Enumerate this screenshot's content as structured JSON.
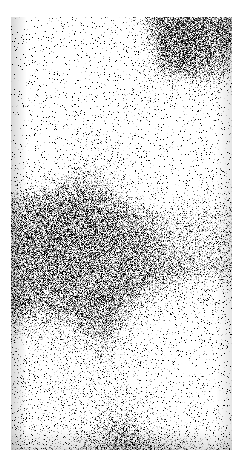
{
  "page": {
    "width": 246,
    "height": 466,
    "background_color": "#ffffff"
  },
  "photo": {
    "label": "grain-photograph",
    "description": "High-contrast grainy monochrome photograph",
    "x": 11,
    "y": 17,
    "width": 221,
    "height": 433,
    "palette": {
      "highlight": "#ffffff",
      "light": "#e8e8e8",
      "midtone": "#8a8a8a",
      "shadow": "#2a2a2a",
      "black": "#141414"
    },
    "regions": [
      {
        "name": "upper-left-highlight",
        "tone": "bright",
        "value": "#f4f4f4"
      },
      {
        "name": "upper-right-shadow",
        "tone": "dark",
        "value": "#1a1a1a"
      },
      {
        "name": "mid-right-light-patch",
        "tone": "light",
        "value": "#d4d4d4"
      },
      {
        "name": "center-dark-mass",
        "tone": "dark",
        "value": "#333333"
      },
      {
        "name": "lower-left-midtone",
        "tone": "mid-dark",
        "value": "#8a8a8a"
      },
      {
        "name": "lower-right-midtone",
        "tone": "mid-light",
        "value": "#b0b0b0"
      }
    ]
  }
}
